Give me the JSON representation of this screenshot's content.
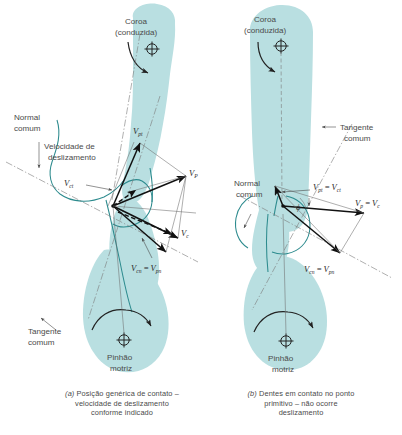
{
  "figure": {
    "title_semantic": "gear-tooth-contact-sliding-velocity-diagram",
    "colors": {
      "gear_fill": "#b9dfe1",
      "gear_outline": "#2d8b8e",
      "vector_black": "#111111",
      "construction_gray": "#7a7a7a",
      "label_text": "#4a4a4a"
    }
  },
  "panel_a": {
    "gear_driven_label_line1": "Coroa",
    "gear_driven_label_line2": "(conduzida)",
    "gear_driving_label_line1": "Pinhão",
    "gear_driving_label_line2": "motriz",
    "normal_label_line1": "Normal",
    "normal_label_line2": "comum",
    "tangent_label_line1": "Tangente",
    "tangent_label_line2": "comum",
    "sliding_label_line1": "Velocidade de",
    "sliding_label_line2": "deslizamento",
    "vectors": [
      {
        "name": "v-pt",
        "base": "V",
        "sub": "pt"
      },
      {
        "name": "v-ct",
        "base": "V",
        "sub": "ct"
      },
      {
        "name": "v-p",
        "base": "V",
        "sub": "P"
      },
      {
        "name": "v-c",
        "base": "V",
        "sub": "c"
      },
      {
        "name": "v-cn-eq-v-pn",
        "base": "V",
        "sub": "cn",
        "eq": "=",
        "base2": "V",
        "sub2": "pn"
      }
    ],
    "caption_marker": "(a)",
    "caption_line1": "Posição genérica de contato –",
    "caption_line2": "velocidade de deslizamento",
    "caption_line3": "conforme indicado"
  },
  "panel_b": {
    "gear_driven_label_line1": "Coroa",
    "gear_driven_label_line2": "(conduzida)",
    "gear_driving_label_line1": "Pinhão",
    "gear_driving_label_line2": "motriz",
    "normal_label_line1": "Normal",
    "normal_label_line2": "comum",
    "tangent_label_line1": "Tangente",
    "tangent_label_line2": "comum",
    "angle_symbol": "ϕ",
    "vectors": [
      {
        "name": "v-pt-eq-v-ct",
        "base": "V",
        "sub": "pt",
        "eq": "=",
        "base2": "V",
        "sub2": "ct"
      },
      {
        "name": "v-p-eq-v-c",
        "base": "V",
        "sub": "p",
        "eq": "=",
        "base2": "V",
        "sub2": "c"
      },
      {
        "name": "v-cn-eq-v-pn",
        "base": "V",
        "sub": "cn",
        "eq": "=",
        "base2": "V",
        "sub2": "pn"
      }
    ],
    "caption_marker": "(b)",
    "caption_line1": "Dentes em contato no ponto",
    "caption_line2": "primitivo – não ocorre",
    "caption_line3": "deslizamento"
  }
}
